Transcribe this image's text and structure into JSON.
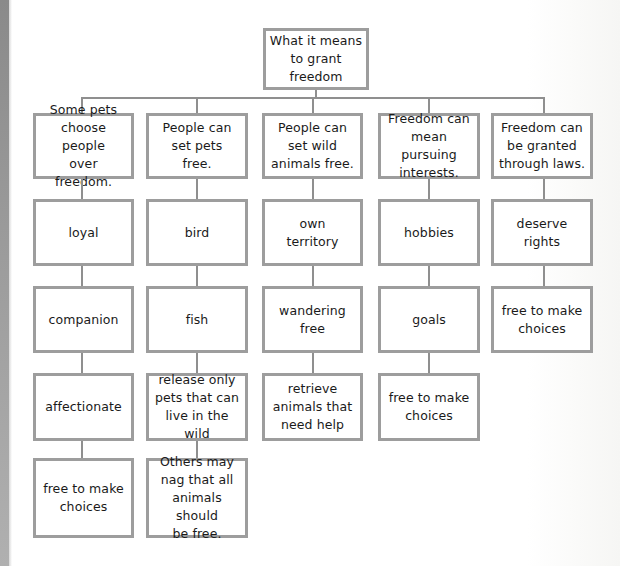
{
  "diagram": {
    "type": "tree-map",
    "root": {
      "label": "What it means\nto grant\nfreedom"
    },
    "colors": {
      "border": "#9d9d9d",
      "connector": "#8f8f8f",
      "text": "#1a1a1a",
      "background": "#ffffff"
    },
    "columns": [
      {
        "heading": "Some pets\nchoose people\nover freedom.",
        "details": [
          "loyal",
          "companion",
          "affectionate",
          "free to make\nchoices"
        ]
      },
      {
        "heading": "People can\nset pets\nfree.",
        "details": [
          "bird",
          "fish",
          "release only\npets that can\nlive in the wild",
          "Others may\nnag that all\nanimals should\nbe free."
        ]
      },
      {
        "heading": "People can\nset wild\nanimals free.",
        "details": [
          "own\nterritory",
          "wandering\nfree",
          "retrieve\nanimals that\nneed help"
        ]
      },
      {
        "heading": "Freedom can\nmean pursuing\ninterests.",
        "details": [
          "hobbies",
          "goals",
          "free to make\nchoices"
        ]
      },
      {
        "heading": "Freedom can\nbe granted\nthrough laws.",
        "details": [
          "deserve\nrights",
          "free to make\nchoices"
        ]
      }
    ]
  }
}
